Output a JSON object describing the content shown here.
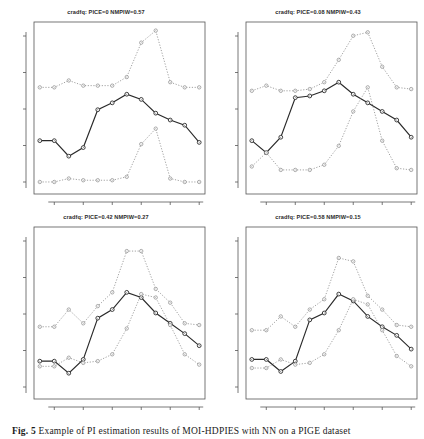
{
  "figure": {
    "caption_label": "Fig. 5",
    "caption_text": "Example of PI estimation results of MOI-HDPIES with NN on a PIGE dataset",
    "panel_count": 4
  },
  "axis": {
    "x_ticks": [
      2,
      4,
      6,
      8,
      10,
      12
    ],
    "x_min": 1,
    "x_max": 12,
    "y_ticks": [
      "",
      "",
      "",
      "",
      ""
    ],
    "grid": false
  },
  "panels": [
    {
      "id": "panel-top-left",
      "title": "cradfq: PICE=0 NMPIW=0.57",
      "pice": "0",
      "nmpiw": "0.57",
      "chart_data": {
        "type": "line",
        "title": "cradfq: PICE=0 NMPIW=0.57",
        "xlabel": "",
        "ylabel": "",
        "x": [
          1,
          2,
          3,
          4,
          5,
          6,
          7,
          8,
          9,
          10,
          11,
          12
        ],
        "xlim": [
          0.6,
          12.4
        ],
        "ylim": [
          0,
          1
        ],
        "grid": false,
        "legend": "none",
        "series": [
          {
            "name": "upper-bound",
            "style": "dotted",
            "values": [
              0.62,
              0.62,
              0.66,
              0.63,
              0.63,
              0.63,
              0.68,
              0.88,
              0.95,
              0.65,
              0.62,
              0.62
            ]
          },
          {
            "name": "target",
            "style": "solid",
            "values": [
              0.31,
              0.31,
              0.22,
              0.27,
              0.49,
              0.53,
              0.58,
              0.55,
              0.47,
              0.43,
              0.4,
              0.3
            ]
          },
          {
            "name": "lower-bound",
            "style": "dotted",
            "values": [
              0.07,
              0.07,
              0.09,
              0.08,
              0.08,
              0.08,
              0.1,
              0.29,
              0.38,
              0.09,
              0.07,
              0.07
            ]
          }
        ]
      }
    },
    {
      "id": "panel-top-right",
      "title": "cradfq: PICE=0.08 NMPIW=0.43",
      "pice": "0.08",
      "nmpiw": "0.43",
      "chart_data": {
        "type": "line",
        "title": "cradfq: PICE=0.08 NMPIW=0.43",
        "xlabel": "",
        "ylabel": "",
        "x": [
          1,
          2,
          3,
          4,
          5,
          6,
          7,
          8,
          9,
          10,
          11,
          12
        ],
        "xlim": [
          0.6,
          12.4
        ],
        "ylim": [
          0,
          1
        ],
        "grid": false,
        "legend": "none",
        "series": [
          {
            "name": "upper-bound",
            "style": "dotted",
            "values": [
              0.6,
              0.63,
              0.6,
              0.6,
              0.61,
              0.65,
              0.78,
              0.92,
              0.94,
              0.74,
              0.62,
              0.61
            ]
          },
          {
            "name": "target",
            "style": "solid",
            "values": [
              0.31,
              0.24,
              0.33,
              0.56,
              0.57,
              0.6,
              0.65,
              0.58,
              0.53,
              0.48,
              0.43,
              0.33
            ]
          },
          {
            "name": "lower-bound",
            "style": "dotted",
            "values": [
              0.16,
              0.24,
              0.14,
              0.14,
              0.14,
              0.17,
              0.28,
              0.48,
              0.62,
              0.31,
              0.15,
              0.14
            ]
          }
        ]
      }
    },
    {
      "id": "panel-bottom-left",
      "title": "cradfq: PICE=0.42 NMPIW=0.27",
      "pice": "0.42",
      "nmpiw": "0.27",
      "chart_data": {
        "type": "line",
        "title": "cradfq: PICE=0.42 NMPIW=0.27",
        "xlabel": "",
        "ylabel": "",
        "x": [
          1,
          2,
          3,
          4,
          5,
          6,
          7,
          8,
          9,
          10,
          11,
          12
        ],
        "xlim": [
          0.6,
          12.4
        ],
        "ylim": [
          0,
          1
        ],
        "grid": false,
        "legend": "none",
        "series": [
          {
            "name": "upper-bound",
            "style": "dotted",
            "values": [
              0.42,
              0.42,
              0.52,
              0.44,
              0.54,
              0.62,
              0.86,
              0.86,
              0.64,
              0.56,
              0.44,
              0.43
            ]
          },
          {
            "name": "target",
            "style": "solid",
            "values": [
              0.22,
              0.22,
              0.15,
              0.23,
              0.47,
              0.52,
              0.62,
              0.59,
              0.5,
              0.44,
              0.38,
              0.31
            ]
          },
          {
            "name": "lower-bound",
            "style": "dotted",
            "values": [
              0.19,
              0.19,
              0.24,
              0.21,
              0.22,
              0.26,
              0.41,
              0.61,
              0.59,
              0.43,
              0.26,
              0.2
            ]
          }
        ]
      }
    },
    {
      "id": "panel-bottom-right",
      "title": "cradfq: PICE=0.58 NMPIW=0.15",
      "pice": "0.58",
      "nmpiw": "0.15",
      "chart_data": {
        "type": "line",
        "title": "cradfq: PICE=0.58 NMPIW=0.15",
        "xlabel": "",
        "ylabel": "",
        "x": [
          1,
          2,
          3,
          4,
          5,
          6,
          7,
          8,
          9,
          10,
          11,
          12
        ],
        "xlim": [
          0.6,
          12.4
        ],
        "ylim": [
          0,
          1
        ],
        "grid": false,
        "legend": "none",
        "series": [
          {
            "name": "upper-bound",
            "style": "dotted",
            "values": [
              0.4,
              0.4,
              0.48,
              0.42,
              0.52,
              0.58,
              0.82,
              0.8,
              0.6,
              0.52,
              0.43,
              0.42
            ]
          },
          {
            "name": "target",
            "style": "solid",
            "values": [
              0.23,
              0.23,
              0.16,
              0.22,
              0.46,
              0.5,
              0.61,
              0.57,
              0.48,
              0.42,
              0.37,
              0.29
            ]
          },
          {
            "name": "lower-bound",
            "style": "dotted",
            "values": [
              0.18,
              0.18,
              0.23,
              0.2,
              0.21,
              0.26,
              0.4,
              0.58,
              0.55,
              0.4,
              0.25,
              0.19
            ]
          }
        ]
      }
    }
  ],
  "colors": {
    "axis": "#555555",
    "target_line": "#2a2a2a",
    "bound_line": "#8a8a8a",
    "marker_fill": "#ffffff",
    "background": "#ffffff",
    "text": "#2b2b2b"
  }
}
